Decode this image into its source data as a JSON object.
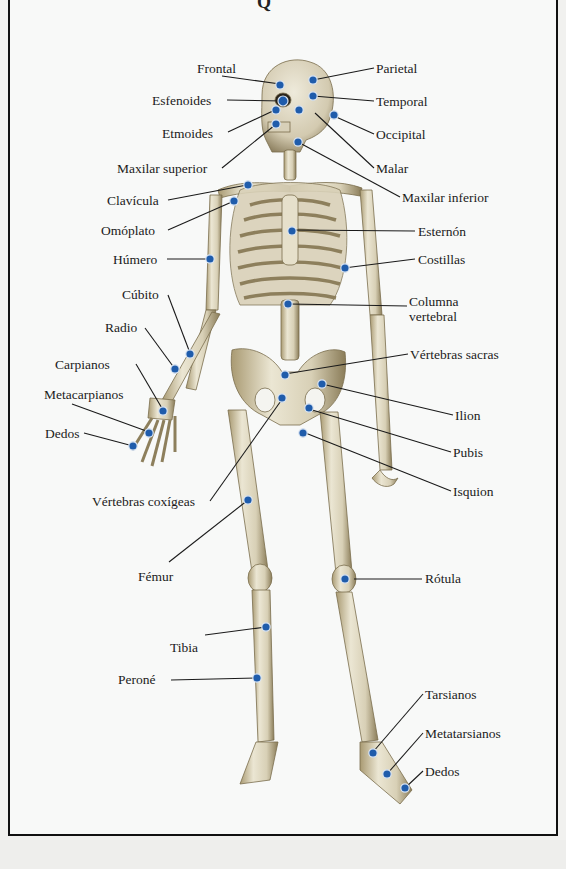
{
  "diagram": {
    "title_fragment": "Q",
    "colors": {
      "marker": "#1f5cab",
      "marker_ring": "#d9e4f2",
      "bone": "#e2dcc6",
      "bone_shadow": "#8d7f5c",
      "leader_line": "#1a1a1a",
      "frame": "#111111",
      "paper": "#f8f9f8"
    },
    "labels": {
      "frontal": "Frontal",
      "parietal": "Parietal",
      "esfenoides": "Esfenoides",
      "temporal": "Temporal",
      "etmoides": "Etmoides",
      "occipital": "Occipital",
      "maxilar_superior": "Maxilar superior",
      "malar": "Malar",
      "maxilar_inferior": "Maxilar inferior",
      "clavicula": "Clavícula",
      "omoplato": "Omóplato",
      "esternon": "Esternón",
      "humero": "Húmero",
      "costillas": "Costillas",
      "cubito": "Cúbito",
      "columna_vertebral": "Columna vertebral",
      "radio": "Radio",
      "vertebras_sacras": "Vértebras sacras",
      "carpianos": "Carpianos",
      "metacarpianos": "Metacarpianos",
      "ilion": "Ilion",
      "dedos_mano": "Dedos",
      "pubis": "Pubis",
      "isquion": "Isquion",
      "vertebras_coxigeas": "Vértebras coxígeas",
      "femur": "Fémur",
      "rotula": "Rótula",
      "tibia": "Tibia",
      "perone": "Peroné",
      "tarsianos": "Tarsianos",
      "metatarsianos": "Metatarsianos",
      "dedos_pie": "Dedos"
    }
  }
}
